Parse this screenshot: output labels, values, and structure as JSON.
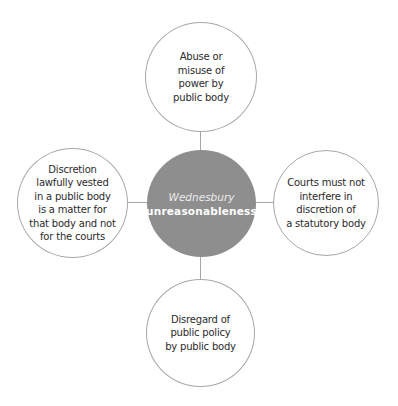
{
  "diagram": {
    "type": "hub-and-spoke",
    "center": {
      "title_italic": "Wednesbury",
      "title_bold": "unreasonableness",
      "fill_color": "#8e8e8e",
      "text_color": "#ffffff"
    },
    "nodes": {
      "top": {
        "label": "Abuse or\nmisuse of\npower by\npublic body"
      },
      "right": {
        "label": "Courts must not\ninterfere in\ndiscretion of\na statutory body"
      },
      "bottom": {
        "label": "Disregard of\npublic policy\nby public body"
      },
      "left": {
        "label": "Discretion\nlawfully vested\nin a public body\nis a matter for\nthat body and not\nfor the courts"
      }
    },
    "colors": {
      "outline": "#a8a8a8",
      "connector": "#a6a6a6",
      "text": "#2b2b2b",
      "background": "#ffffff"
    }
  }
}
